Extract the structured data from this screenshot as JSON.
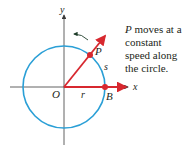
{
  "diagram": {
    "axis_labels": {
      "x": "x",
      "y": "y"
    },
    "point_labels": {
      "origin": "O",
      "moving_point": "P",
      "fixed_point": "B"
    },
    "segment_labels": {
      "radius": "r",
      "arc": "s"
    },
    "caption": {
      "subject": "P",
      "text": " moves at a constant speed along the circle."
    },
    "colors": {
      "circle": "#2a9fd6",
      "vectors": "#d7282f",
      "axes": "#3a3a3a",
      "arrow_hint": "#1f3d2a"
    }
  }
}
